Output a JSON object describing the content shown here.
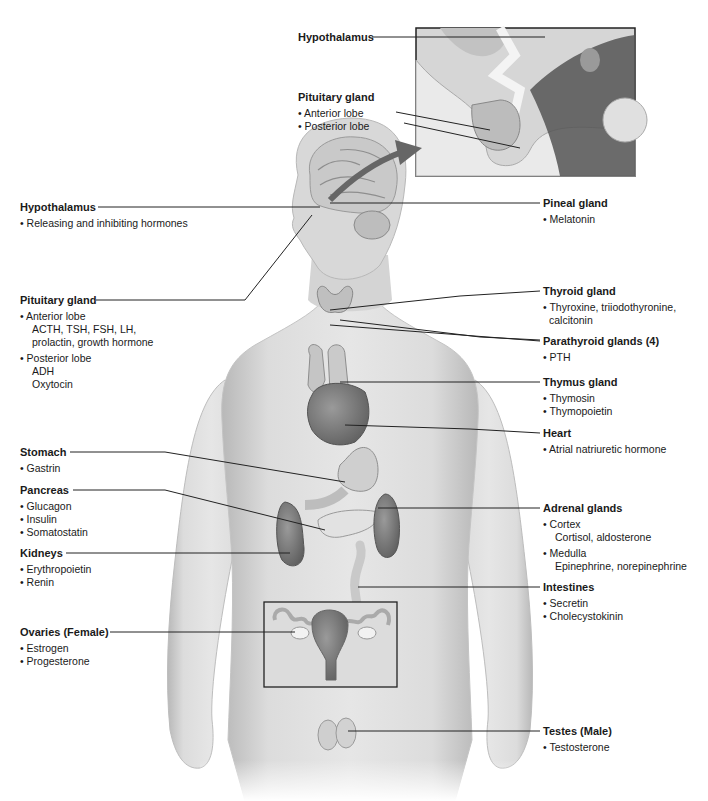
{
  "diagram": {
    "topic": "Endocrine system",
    "inset": {
      "hypothalamus_label": "Hypothalamus",
      "pituitary": {
        "title": "Pituitary gland",
        "items": [
          "• Anterior lobe",
          "• Posterior lobe"
        ]
      }
    },
    "labels": {
      "hypothalamus": {
        "title": "Hypothalamus",
        "items": [
          "• Releasing and inhibiting hormones"
        ]
      },
      "pituitary": {
        "title": "Pituitary gland",
        "anterior": "• Anterior lobe",
        "anterior_sub1": "ACTH, TSH, FSH, LH,",
        "anterior_sub2": "prolactin, growth hormone",
        "posterior": "• Posterior lobe",
        "posterior_sub1": "ADH",
        "posterior_sub2": "Oxytocin"
      },
      "pineal": {
        "title": "Pineal gland",
        "items": [
          "• Melatonin"
        ]
      },
      "thyroid": {
        "title": "Thyroid gland",
        "item1": "• Thyroxine, triiodothyronine,",
        "item1_cont": "calcitonin"
      },
      "parathyroid": {
        "title": "Parathyroid glands (4)",
        "items": [
          "• PTH"
        ]
      },
      "thymus": {
        "title": "Thymus gland",
        "items": [
          "• Thymosin",
          "• Thymopoietin"
        ]
      },
      "heart": {
        "title": "Heart",
        "items": [
          "• Atrial natriuretic hormone"
        ]
      },
      "stomach": {
        "title": "Stomach",
        "items": [
          "• Gastrin"
        ]
      },
      "pancreas": {
        "title": "Pancreas",
        "items": [
          "• Glucagon",
          "• Insulin",
          "• Somatostatin"
        ]
      },
      "kidneys": {
        "title": "Kidneys",
        "items": [
          "• Erythropoietin",
          "• Renin"
        ]
      },
      "adrenal": {
        "title": "Adrenal glands",
        "cortex": "• Cortex",
        "cortex_sub": "Cortisol, aldosterone",
        "medulla": "• Medulla",
        "medulla_sub": "Epinephrine, norepinephrine"
      },
      "intestines": {
        "title": "Intestines",
        "items": [
          "• Secretin",
          "• Cholecystokinin"
        ]
      },
      "ovaries": {
        "title": "Ovaries (Female)",
        "items": [
          "• Estrogen",
          "• Progesterone"
        ]
      },
      "testes": {
        "title": "Testes (Male)",
        "items": [
          "• Testosterone"
        ]
      }
    },
    "colors": {
      "skin": "#d9d9d9",
      "skin_shadow": "#b5b5b5",
      "organ_dark": "#7a7a7a",
      "organ_light": "#c8c8c8",
      "leader_line": "#222222",
      "arrow": "#666666"
    }
  }
}
